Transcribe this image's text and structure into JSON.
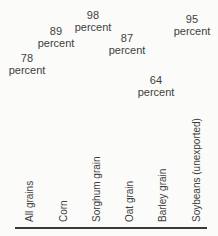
{
  "chart_data": {
    "type": "bar",
    "categories": [
      "All grains",
      "Corn",
      "Sorghum grain",
      "Oat grain",
      "Barley grain",
      "Soybeans (unexported)"
    ],
    "values": [
      78,
      89,
      98,
      87,
      64,
      95
    ],
    "unit": "percent",
    "title": "",
    "xlabel": "",
    "ylabel": "",
    "legend": "none",
    "grid": "off",
    "layout_hints": {
      "bars_visible": false,
      "value_labels": "floating two-line labels ('<value>' over 'percent') positioned at heights proportional to value",
      "category_labels": "rotated 90deg counter-clockwise, bottom-aligned above baseline",
      "baseline_axis": true
    }
  },
  "labels": {
    "percent_word": "percent"
  },
  "colors": {
    "text": "#3e3e3e",
    "axis": "#3a3a3a",
    "background": "#fbfbf9"
  }
}
